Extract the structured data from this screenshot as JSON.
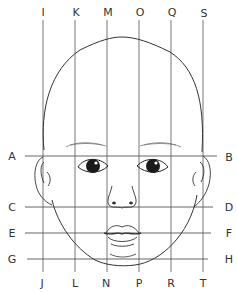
{
  "diagram": {
    "colors": {
      "line": "#555555",
      "ink": "#222222",
      "background": "#ffffff"
    },
    "horizontal_guides": [
      {
        "left_label": "A",
        "right_label": "B",
        "y": 156,
        "feature": "eye line"
      },
      {
        "left_label": "C",
        "right_label": "D",
        "y": 207,
        "feature": "nose base"
      },
      {
        "left_label": "E",
        "right_label": "F",
        "y": 233,
        "feature": "mouth line"
      },
      {
        "left_label": "G",
        "right_label": "H",
        "y": 259,
        "feature": "chin"
      }
    ],
    "vertical_guides": [
      {
        "top_label": "I",
        "bottom_label": "J",
        "x": 43
      },
      {
        "top_label": "K",
        "bottom_label": "L",
        "x": 75
      },
      {
        "top_label": "M",
        "bottom_label": "N",
        "x": 107
      },
      {
        "top_label": "O",
        "bottom_label": "P",
        "x": 139
      },
      {
        "top_label": "Q",
        "bottom_label": "R",
        "x": 171
      },
      {
        "top_label": "S",
        "bottom_label": "T",
        "x": 203
      }
    ]
  }
}
